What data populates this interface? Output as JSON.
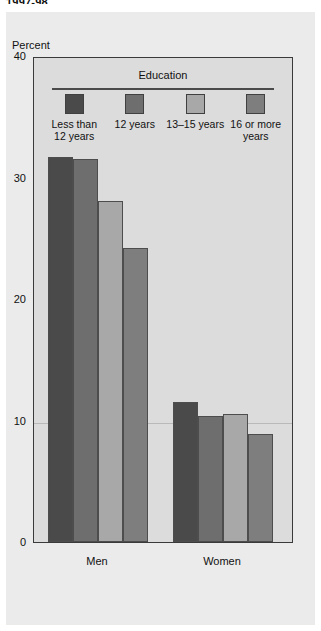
{
  "top_caption": "1997-98",
  "axis_title": "Percent",
  "legend": {
    "title": "Education",
    "items": [
      {
        "label": "Less than\n12 years",
        "color": "#4a4a4a"
      },
      {
        "label": "12 years",
        "color": "#6e6e6e"
      },
      {
        "label": "13–15 years",
        "color": "#a8a8a8"
      },
      {
        "label": "16 or more\nyears",
        "color": "#7e7e7e"
      }
    ]
  },
  "chart_data": {
    "type": "bar",
    "title": "",
    "xlabel": "",
    "ylabel": "Percent",
    "ylim": [
      0,
      40
    ],
    "yticks": [
      0,
      10,
      20,
      30,
      40
    ],
    "ytick_labels": [
      "0",
      "10",
      "20",
      "30",
      "40"
    ],
    "grid": "horizontal line at 10",
    "legend_position": "inside-top",
    "categories": [
      "Men",
      "Women"
    ],
    "series": [
      {
        "name": "Less than 12 years",
        "color": "#4a4a4a",
        "values": [
          31.7,
          11.5
        ]
      },
      {
        "name": "12 years",
        "color": "#6e6e6e",
        "values": [
          31.5,
          10.4
        ]
      },
      {
        "name": "13–15 years",
        "color": "#a8a8a8",
        "values": [
          28.1,
          10.5
        ]
      },
      {
        "name": "16 or more years",
        "color": "#7e7e7e",
        "values": [
          24.2,
          8.9
        ]
      }
    ]
  },
  "colors": {
    "panel_background": "#ebebeb",
    "plot_background": "#dcdcdc",
    "frame": "#3a3a3a",
    "gridline": "#b9b9b9",
    "text": "#111111"
  }
}
